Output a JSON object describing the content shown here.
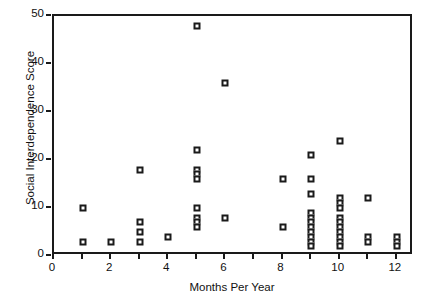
{
  "chart_data": {
    "type": "scatter",
    "title": "",
    "xlabel": "Months Per Year",
    "ylabel": "Social Interdependence Score",
    "xlim": [
      0,
      12.6
    ],
    "ylim": [
      0,
      50
    ],
    "grid": false,
    "legend": null,
    "marker": "open-square",
    "marker_color": "#1a1a1a",
    "x_tick_values": [
      0,
      1,
      2,
      3,
      4,
      5,
      6,
      7,
      8,
      9,
      10,
      11,
      12
    ],
    "x_tick_labels": [
      "0",
      "",
      "2",
      "",
      "4",
      "",
      "6",
      "",
      "8",
      "",
      "10",
      "",
      "12"
    ],
    "y_tick_values": [
      0,
      10,
      20,
      30,
      40,
      50
    ],
    "y_tick_labels": [
      "0",
      "10",
      "20",
      "30",
      "40",
      "50"
    ],
    "points": [
      {
        "x": 1,
        "y": 10
      },
      {
        "x": 1,
        "y": 3
      },
      {
        "x": 2,
        "y": 3
      },
      {
        "x": 3,
        "y": 18
      },
      {
        "x": 3,
        "y": 7
      },
      {
        "x": 3,
        "y": 5
      },
      {
        "x": 3,
        "y": 3
      },
      {
        "x": 4,
        "y": 4
      },
      {
        "x": 5,
        "y": 48
      },
      {
        "x": 5,
        "y": 22
      },
      {
        "x": 5,
        "y": 18
      },
      {
        "x": 5,
        "y": 17
      },
      {
        "x": 5,
        "y": 16
      },
      {
        "x": 5,
        "y": 10
      },
      {
        "x": 5,
        "y": 8
      },
      {
        "x": 5,
        "y": 7
      },
      {
        "x": 5,
        "y": 6
      },
      {
        "x": 6,
        "y": 36
      },
      {
        "x": 6,
        "y": 8
      },
      {
        "x": 8,
        "y": 16
      },
      {
        "x": 8,
        "y": 6
      },
      {
        "x": 9,
        "y": 21
      },
      {
        "x": 9,
        "y": 16
      },
      {
        "x": 9,
        "y": 13
      },
      {
        "x": 9,
        "y": 9
      },
      {
        "x": 9,
        "y": 8
      },
      {
        "x": 9,
        "y": 7
      },
      {
        "x": 9,
        "y": 6
      },
      {
        "x": 9,
        "y": 5
      },
      {
        "x": 9,
        "y": 4
      },
      {
        "x": 9,
        "y": 3
      },
      {
        "x": 9,
        "y": 2
      },
      {
        "x": 10,
        "y": 24
      },
      {
        "x": 10,
        "y": 12
      },
      {
        "x": 10,
        "y": 11
      },
      {
        "x": 10,
        "y": 10
      },
      {
        "x": 10,
        "y": 8
      },
      {
        "x": 10,
        "y": 7
      },
      {
        "x": 10,
        "y": 6
      },
      {
        "x": 10,
        "y": 5
      },
      {
        "x": 10,
        "y": 4
      },
      {
        "x": 10,
        "y": 3
      },
      {
        "x": 10,
        "y": 2
      },
      {
        "x": 11,
        "y": 12
      },
      {
        "x": 11,
        "y": 4
      },
      {
        "x": 11,
        "y": 3
      },
      {
        "x": 12,
        "y": 4
      },
      {
        "x": 12,
        "y": 3
      },
      {
        "x": 12,
        "y": 2
      }
    ]
  }
}
